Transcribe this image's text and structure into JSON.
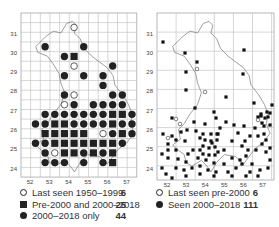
{
  "left_map": {
    "y_ticks": [
      "31",
      "30",
      "29",
      "28",
      "27",
      "26",
      "25",
      "24"
    ],
    "x_ticks": [
      "52",
      "53",
      "54",
      "55",
      "56",
      "57"
    ],
    "grid": {
      "cols": 12,
      "rows": 17
    },
    "cells": [
      {
        "r": 1,
        "c": 5,
        "t": "open"
      },
      {
        "r": 3,
        "c": 2,
        "t": "filled"
      },
      {
        "r": 3,
        "c": 6,
        "t": "filled"
      },
      {
        "r": 4,
        "c": 4,
        "t": "filled"
      },
      {
        "r": 4,
        "c": 5,
        "t": "square"
      },
      {
        "r": 5,
        "c": 5,
        "t": "open"
      },
      {
        "r": 5,
        "c": 9,
        "t": "filled"
      },
      {
        "r": 6,
        "c": 4,
        "t": "filled"
      },
      {
        "r": 6,
        "c": 6,
        "t": "filled"
      },
      {
        "r": 6,
        "c": 8,
        "t": "filled"
      },
      {
        "r": 7,
        "c": 8,
        "t": "filled"
      },
      {
        "r": 8,
        "c": 4,
        "t": "filled"
      },
      {
        "r": 8,
        "c": 5,
        "t": "open"
      },
      {
        "r": 8,
        "c": 9,
        "t": "filled"
      },
      {
        "r": 8,
        "c": 10,
        "t": "filled"
      },
      {
        "r": 9,
        "c": 4,
        "t": "open"
      },
      {
        "r": 9,
        "c": 5,
        "t": "filled"
      },
      {
        "r": 9,
        "c": 7,
        "t": "filled"
      },
      {
        "r": 9,
        "c": 8,
        "t": "filled"
      },
      {
        "r": 9,
        "c": 9,
        "t": "filled"
      },
      {
        "r": 9,
        "c": 10,
        "t": "filled"
      },
      {
        "r": 10,
        "c": 2,
        "t": "filled"
      },
      {
        "r": 10,
        "c": 3,
        "t": "filled"
      },
      {
        "r": 10,
        "c": 4,
        "t": "filled"
      },
      {
        "r": 10,
        "c": 5,
        "t": "filled"
      },
      {
        "r": 10,
        "c": 6,
        "t": "filled"
      },
      {
        "r": 10,
        "c": 7,
        "t": "filled"
      },
      {
        "r": 10,
        "c": 8,
        "t": "filled"
      },
      {
        "r": 10,
        "c": 9,
        "t": "square"
      },
      {
        "r": 10,
        "c": 10,
        "t": "square"
      },
      {
        "r": 10,
        "c": 11,
        "t": "filled"
      },
      {
        "r": 11,
        "c": 1,
        "t": "filled"
      },
      {
        "r": 11,
        "c": 2,
        "t": "filled"
      },
      {
        "r": 11,
        "c": 3,
        "t": "square"
      },
      {
        "r": 11,
        "c": 4,
        "t": "square"
      },
      {
        "r": 11,
        "c": 5,
        "t": "filled"
      },
      {
        "r": 11,
        "c": 6,
        "t": "filled"
      },
      {
        "r": 11,
        "c": 7,
        "t": "filled"
      },
      {
        "r": 11,
        "c": 8,
        "t": "filled"
      },
      {
        "r": 11,
        "c": 9,
        "t": "square"
      },
      {
        "r": 11,
        "c": 10,
        "t": "filled"
      },
      {
        "r": 11,
        "c": 11,
        "t": "filled"
      },
      {
        "r": 12,
        "c": 2,
        "t": "square"
      },
      {
        "r": 12,
        "c": 3,
        "t": "square"
      },
      {
        "r": 12,
        "c": 4,
        "t": "square"
      },
      {
        "r": 12,
        "c": 5,
        "t": "square"
      },
      {
        "r": 12,
        "c": 6,
        "t": "square"
      },
      {
        "r": 12,
        "c": 8,
        "t": "open"
      },
      {
        "r": 12,
        "c": 9,
        "t": "filled"
      },
      {
        "r": 12,
        "c": 10,
        "t": "square"
      },
      {
        "r": 12,
        "c": 11,
        "t": "filled"
      },
      {
        "r": 13,
        "c": 1,
        "t": "filled"
      },
      {
        "r": 13,
        "c": 2,
        "t": "filled"
      },
      {
        "r": 13,
        "c": 3,
        "t": "square"
      },
      {
        "r": 13,
        "c": 4,
        "t": "square"
      },
      {
        "r": 13,
        "c": 5,
        "t": "square"
      },
      {
        "r": 13,
        "c": 6,
        "t": "square"
      },
      {
        "r": 13,
        "c": 7,
        "t": "square"
      },
      {
        "r": 13,
        "c": 8,
        "t": "square"
      },
      {
        "r": 13,
        "c": 9,
        "t": "square"
      },
      {
        "r": 13,
        "c": 10,
        "t": "filled"
      },
      {
        "r": 14,
        "c": 2,
        "t": "filled"
      },
      {
        "r": 14,
        "c": 3,
        "t": "open"
      },
      {
        "r": 14,
        "c": 4,
        "t": "square"
      },
      {
        "r": 14,
        "c": 5,
        "t": "square"
      },
      {
        "r": 14,
        "c": 6,
        "t": "filled"
      },
      {
        "r": 14,
        "c": 7,
        "t": "square"
      },
      {
        "r": 14,
        "c": 8,
        "t": "filled"
      },
      {
        "r": 14,
        "c": 9,
        "t": "square"
      },
      {
        "r": 15,
        "c": 2,
        "t": "filled"
      },
      {
        "r": 15,
        "c": 3,
        "t": "filled"
      },
      {
        "r": 15,
        "c": 4,
        "t": "filled"
      },
      {
        "r": 15,
        "c": 6,
        "t": "filled"
      },
      {
        "r": 15,
        "c": 8,
        "t": "filled"
      },
      {
        "r": 15,
        "c": 9,
        "t": "square"
      }
    ],
    "legend": [
      {
        "symbol": "open",
        "label": "Last seen 1950–1999",
        "count": "6"
      },
      {
        "symbol": "square",
        "label": "Pre-2000 and 2000–2018",
        "count": "25"
      },
      {
        "symbol": "filled",
        "label": "2000–2018 only",
        "count": "44"
      }
    ]
  },
  "right_map": {
    "y_ticks": [
      "31",
      "30",
      "29",
      "28",
      "27",
      "26",
      "25",
      "24"
    ],
    "x_ticks": [
      "52",
      "53",
      "54",
      "55",
      "56",
      "57"
    ],
    "dots": [
      [
        163,
        42
      ],
      [
        185,
        53
      ],
      [
        244,
        50
      ],
      [
        197,
        62
      ],
      [
        186,
        72
      ],
      [
        243,
        74
      ],
      [
        288,
        72
      ],
      [
        287,
        79
      ],
      [
        276,
        90
      ],
      [
        186,
        90
      ],
      [
        195,
        108
      ],
      [
        214,
        112
      ],
      [
        226,
        97
      ],
      [
        254,
        103
      ],
      [
        272,
        105
      ],
      [
        284,
        108
      ],
      [
        284,
        113
      ],
      [
        261,
        114
      ],
      [
        268,
        117
      ],
      [
        270,
        113
      ],
      [
        265,
        118
      ],
      [
        258,
        117
      ],
      [
        267,
        112
      ],
      [
        261,
        116
      ],
      [
        172,
        118
      ],
      [
        194,
        122
      ],
      [
        205,
        124
      ],
      [
        216,
        118
      ],
      [
        226,
        122
      ],
      [
        234,
        125
      ],
      [
        244,
        126
      ],
      [
        218,
        134
      ],
      [
        181,
        132
      ],
      [
        187,
        130
      ],
      [
        196,
        131
      ],
      [
        163,
        134
      ],
      [
        172,
        136
      ],
      [
        176,
        140
      ],
      [
        168,
        144
      ],
      [
        185,
        141
      ],
      [
        200,
        138
      ],
      [
        212,
        143
      ],
      [
        232,
        141
      ],
      [
        245,
        141
      ],
      [
        262,
        123
      ],
      [
        255,
        128
      ],
      [
        264,
        134
      ],
      [
        266,
        140
      ],
      [
        262,
        144
      ],
      [
        270,
        148
      ],
      [
        266,
        152
      ],
      [
        256,
        150
      ],
      [
        248,
        150
      ],
      [
        242,
        146
      ],
      [
        224,
        150
      ],
      [
        218,
        152
      ],
      [
        200,
        150
      ],
      [
        193,
        150
      ],
      [
        188,
        154
      ],
      [
        176,
        150
      ],
      [
        168,
        150
      ],
      [
        162,
        154
      ],
      [
        168,
        158
      ],
      [
        178,
        159
      ],
      [
        186,
        162
      ],
      [
        198,
        158
      ],
      [
        206,
        160
      ],
      [
        214,
        163
      ],
      [
        224,
        164
      ],
      [
        232,
        158
      ],
      [
        240,
        160
      ],
      [
        246,
        156
      ],
      [
        252,
        164
      ],
      [
        260,
        170
      ],
      [
        268,
        168
      ],
      [
        270,
        160
      ],
      [
        264,
        126
      ],
      [
        270,
        125
      ],
      [
        203,
        146
      ],
      [
        209,
        148
      ],
      [
        215,
        147
      ],
      [
        203,
        154
      ],
      [
        209,
        155
      ],
      [
        215,
        155
      ],
      [
        205,
        140
      ],
      [
        211,
        141
      ],
      [
        217,
        140
      ],
      [
        203,
        134
      ],
      [
        211,
        134
      ],
      [
        217,
        134
      ],
      [
        220,
        128
      ],
      [
        176,
        168
      ],
      [
        184,
        170
      ],
      [
        192,
        168
      ],
      [
        200,
        166
      ],
      [
        208,
        170
      ],
      [
        216,
        172
      ],
      [
        228,
        172
      ],
      [
        236,
        168
      ],
      [
        250,
        172
      ],
      [
        258,
        176
      ],
      [
        162,
        168
      ],
      [
        166,
        174
      ],
      [
        172,
        178
      ],
      [
        186,
        176
      ],
      [
        200,
        174
      ],
      [
        214,
        176
      ],
      [
        232,
        176
      ],
      [
        246,
        176
      ],
      [
        242,
        164
      ],
      [
        238,
        133
      ],
      [
        250,
        136
      ],
      [
        258,
        136
      ]
    ],
    "open_dots": [
      [
        197,
        69
      ],
      [
        205,
        92
      ],
      [
        176,
        119
      ],
      [
        180,
        124
      ],
      [
        168,
        138
      ],
      [
        258,
        120
      ]
    ],
    "legend": [
      {
        "symbol": "open",
        "label": "Last seen pre-2000",
        "count": "6"
      },
      {
        "symbol": "filled",
        "label": "Seen 2000–2018",
        "count": "111"
      }
    ]
  }
}
